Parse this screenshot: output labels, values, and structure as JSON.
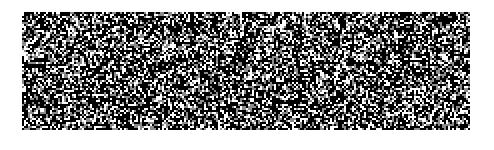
{
  "image": {
    "kind": "random-dot noise pattern",
    "background_color": "#ffffff",
    "panel": {
      "x": 22,
      "y": 12,
      "width": 448,
      "height": 118
    },
    "dot_colors": [
      "#000000",
      "#ffffff",
      "#808080"
    ],
    "seed": 1337
  }
}
